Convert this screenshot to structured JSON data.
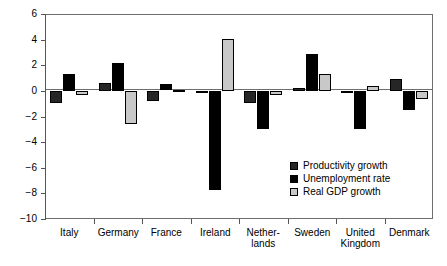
{
  "chart_data": {
    "type": "bar",
    "title": "",
    "subtitle": "",
    "xlabel": "",
    "ylabel": "",
    "ylim": [
      -10,
      6
    ],
    "yticks": [
      6,
      4,
      2,
      0,
      -2,
      -4,
      -6,
      -8,
      -10
    ],
    "ytick_labels": [
      "6",
      "4",
      "2",
      "0",
      "-2",
      "-4",
      "-6",
      "-8",
      "-10"
    ],
    "grid": false,
    "legend_position": "inside-lower-right",
    "categories": [
      "Italy",
      "Germany",
      "France",
      "Ireland",
      "Nether-\nlands",
      "Sweden",
      "United\nKingdom",
      "Denmark"
    ],
    "category_plain": [
      "Italy",
      "Germany",
      "France",
      "Ireland",
      "Netherlands",
      "Sweden",
      "United Kingdom",
      "Denmark"
    ],
    "series": [
      {
        "name": "Productivity growth",
        "color": "#262626",
        "values": [
          -0.9,
          0.6,
          -0.8,
          -0.1,
          -0.9,
          0.25,
          -0.15,
          0.9
        ]
      },
      {
        "name": "Unemployment rate",
        "color": "#000000",
        "values": [
          1.35,
          2.15,
          0.5,
          -7.7,
          -3.0,
          2.9,
          -3.0,
          -1.5
        ]
      },
      {
        "name": "Real GDP growth",
        "color": "#c8c8c8",
        "values": [
          -0.35,
          -2.6,
          0.05,
          4.05,
          -0.35,
          1.3,
          0.4,
          -0.65
        ]
      }
    ]
  },
  "legend": {
    "items": [
      {
        "label": "Productivity growth",
        "color": "#262626"
      },
      {
        "label": "Unemployment rate",
        "color": "#000000"
      },
      {
        "label": "Real GDP growth",
        "color": "#c8c8c8"
      }
    ]
  }
}
